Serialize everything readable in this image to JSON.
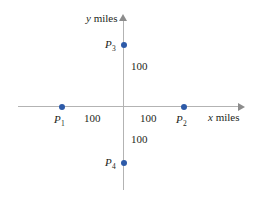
{
  "figure": {
    "width": 255,
    "height": 200,
    "background": "#ffffff",
    "axis_color": "#b3b3b3",
    "point_color": "#2d5aa8",
    "text_color": "#231f20"
  },
  "axes": {
    "x": {
      "label_variable": "x",
      "label_unit": " miles",
      "arrow_direction": "right"
    },
    "y": {
      "label_variable": "y",
      "label_unit": " miles",
      "arrow_direction": "up"
    }
  },
  "points": [
    {
      "id": "p1",
      "label_base": "P",
      "label_sub": "1"
    },
    {
      "id": "p2",
      "label_base": "P",
      "label_sub": "2"
    },
    {
      "id": "p3",
      "label_base": "P",
      "label_sub": "3"
    },
    {
      "id": "p4",
      "label_base": "P",
      "label_sub": "4"
    }
  ],
  "distances": {
    "left": "100",
    "right": "100",
    "up": "100",
    "down": "100"
  },
  "chart_data": {
    "type": "scatter",
    "title": "",
    "xlabel": "x miles",
    "ylabel": "y miles",
    "xlim": [
      -175,
      175
    ],
    "ylim": [
      -150,
      150
    ],
    "grid": false,
    "legend": "none",
    "axis_origin_label": "",
    "series": [
      {
        "name": "points",
        "points": [
          {
            "name": "P1",
            "x": -100,
            "y": 0
          },
          {
            "name": "P2",
            "x": 100,
            "y": 0
          },
          {
            "name": "P3",
            "x": 0,
            "y": 100
          },
          {
            "name": "P4",
            "x": 0,
            "y": -100
          }
        ]
      }
    ],
    "annotations": [
      {
        "text": "100",
        "describes": "distance from origin to P1 along -x axis"
      },
      {
        "text": "100",
        "describes": "distance from origin to P2 along +x axis"
      },
      {
        "text": "100",
        "describes": "distance from origin to P3 along +y axis"
      },
      {
        "text": "100",
        "describes": "distance from origin to P4 along -y axis"
      }
    ]
  }
}
